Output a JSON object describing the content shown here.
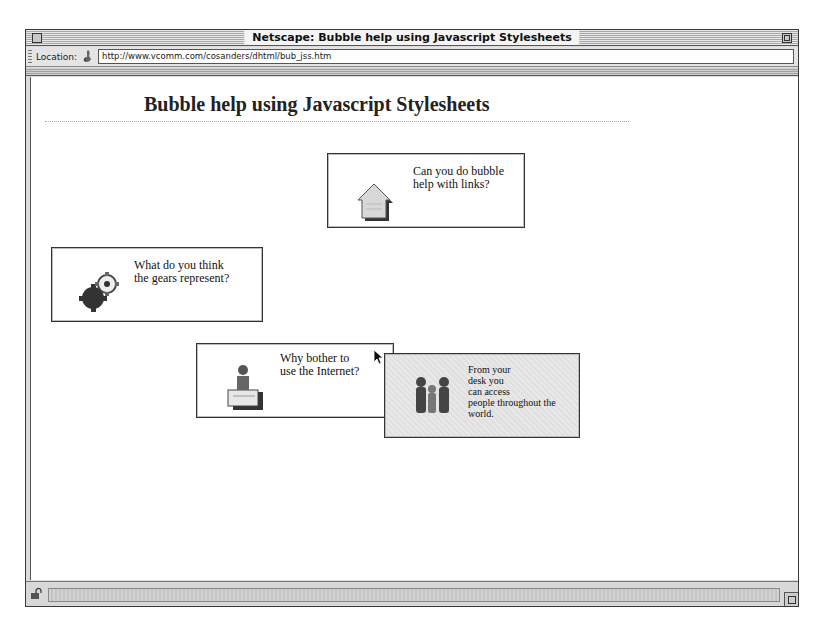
{
  "window": {
    "title": "Netscape: Bubble help using Javascript Stylesheets"
  },
  "location_bar": {
    "label": "Location:",
    "url": "http://www.vcomm.com/cosanders/dhtml/bub_jss.htm"
  },
  "page": {
    "title": "Bubble help using Javascript Stylesheets",
    "bubbles": [
      {
        "id": "links",
        "icon": "house-icon",
        "lines": [
          "Can you do bubble",
          "help with links?"
        ]
      },
      {
        "id": "gears",
        "icon": "gears-icon",
        "lines": [
          "What do you think",
          "the gears represent?"
        ]
      },
      {
        "id": "internet",
        "icon": "person-at-desk-icon",
        "lines": [
          "Why bother to",
          "use the Internet?"
        ]
      },
      {
        "id": "tooltip",
        "icon": "people-icon",
        "lines": [
          "From your",
          "desk you",
          "can access",
          "people throughout the",
          "world."
        ]
      }
    ]
  },
  "status_bar": {
    "icon": "security-lock-icon",
    "text": ""
  }
}
